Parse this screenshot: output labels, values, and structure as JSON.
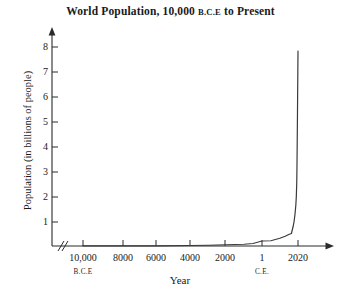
{
  "chart_data": {
    "type": "line",
    "title": "World Population, 10,000 B.C.E to Present",
    "title_main_prefix": "World Population, 10,000 ",
    "title_smallcaps": "B.C.E",
    "title_main_suffix": " to Present",
    "xlabel": "Year",
    "ylabel": "Population (in billions of people)",
    "grid": false,
    "legend": false,
    "axis_break": "//",
    "ylim": [
      0,
      8.6
    ],
    "ytick_labels": [
      "8",
      "7",
      "6",
      "5",
      "4",
      "3",
      "2",
      "1"
    ],
    "ytick_values": [
      8,
      7,
      6,
      5,
      4,
      3,
      2,
      1
    ],
    "xtick_labels": [
      "10,000",
      "8000",
      "6000",
      "4000",
      "2000",
      "1",
      "2020"
    ],
    "xtick_years": [
      -10000,
      -8000,
      -6000,
      -4000,
      -2000,
      1,
      2020
    ],
    "era_labels": [
      {
        "text": "B.C.E",
        "under_tick": "10,000"
      },
      {
        "text": "C.E.",
        "under_tick": "1"
      }
    ],
    "series": [
      {
        "name": "World population",
        "x": [
          -10000,
          -8000,
          -6000,
          -4000,
          -3000,
          -2000,
          -1000,
          -500,
          1,
          500,
          1000,
          1300,
          1500,
          1650,
          1750,
          1800,
          1850,
          1900,
          1927,
          1950,
          1960,
          1974,
          1987,
          1999,
          2011,
          2020
        ],
        "y": [
          0.004,
          0.005,
          0.007,
          0.02,
          0.03,
          0.05,
          0.07,
          0.1,
          0.2,
          0.21,
          0.31,
          0.39,
          0.46,
          0.5,
          0.79,
          0.98,
          1.26,
          1.65,
          2.0,
          2.54,
          3.03,
          4.0,
          5.0,
          6.0,
          7.0,
          7.8
        ]
      }
    ],
    "peak_value": 7.8,
    "peak_year": 2020,
    "axes_color": "#2b2b2b",
    "line_color": "#3a3a3a",
    "background_color": "#ffffff"
  }
}
